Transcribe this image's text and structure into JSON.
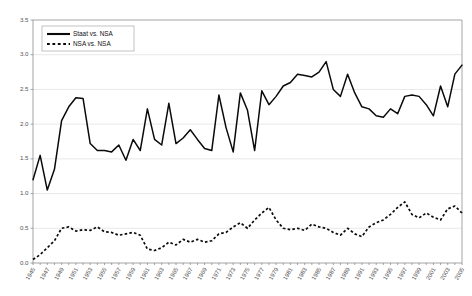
{
  "chart_data": {
    "type": "line",
    "title": "",
    "xlabel": "",
    "ylabel": "",
    "ylim": [
      0.0,
      3.5
    ],
    "ytick_labels": [
      "0.0",
      "0.5",
      "1.0",
      "1.5",
      "2.0",
      "2.5",
      "3.0",
      "3.5"
    ],
    "ytick_values": [
      0.0,
      0.5,
      1.0,
      1.5,
      2.0,
      2.5,
      3.0,
      3.5
    ],
    "grid": true,
    "legend_position": "top-left-inside",
    "x": [
      1945,
      1946,
      1947,
      1948,
      1949,
      1950,
      1951,
      1952,
      1953,
      1954,
      1955,
      1956,
      1957,
      1958,
      1959,
      1960,
      1961,
      1962,
      1963,
      1964,
      1965,
      1966,
      1967,
      1968,
      1969,
      1970,
      1971,
      1972,
      1973,
      1974,
      1975,
      1976,
      1977,
      1978,
      1979,
      1980,
      1981,
      1982,
      1983,
      1984,
      1985,
      1986,
      1987,
      1988,
      1989,
      1990,
      1991,
      1992,
      1993,
      1994,
      1995,
      1996,
      1997,
      1998,
      1999,
      2000,
      2001,
      2002,
      2003,
      2004,
      2005
    ],
    "xtick_labels": [
      "1945",
      "1947",
      "1949",
      "1951",
      "1953",
      "1955",
      "1957",
      "1959",
      "1961",
      "1963",
      "1965",
      "1967",
      "1969",
      "1971",
      "1973",
      "1975",
      "1977",
      "1979",
      "1981",
      "1983",
      "1985",
      "1987",
      "1989",
      "1991",
      "1993",
      "1995",
      "1997",
      "1999",
      "2001",
      "2003",
      "2005"
    ],
    "series": [
      {
        "name": "Staat vs. NSA",
        "style": "solid",
        "color": "#0a0a0a",
        "values": [
          1.2,
          1.55,
          1.05,
          1.35,
          2.05,
          2.25,
          2.38,
          2.37,
          1.72,
          1.62,
          1.62,
          1.6,
          1.7,
          1.48,
          1.78,
          1.62,
          2.22,
          1.78,
          1.7,
          2.3,
          1.72,
          1.8,
          1.92,
          1.78,
          1.65,
          1.62,
          2.42,
          1.95,
          1.6,
          2.45,
          2.2,
          1.62,
          2.48,
          2.28,
          2.4,
          2.55,
          2.6,
          2.72,
          2.7,
          2.68,
          2.75,
          2.9,
          2.5,
          2.4,
          2.72,
          2.45,
          2.25,
          2.22,
          2.12,
          2.1,
          2.22,
          2.15,
          2.4,
          2.42,
          2.4,
          2.28,
          2.12,
          2.55,
          2.25,
          2.72,
          2.85
        ]
      },
      {
        "name": "NSA vs. NSA",
        "style": "dashed",
        "color": "#0a0a0a",
        "values": [
          0.05,
          0.12,
          0.22,
          0.32,
          0.5,
          0.52,
          0.46,
          0.48,
          0.47,
          0.52,
          0.45,
          0.44,
          0.4,
          0.42,
          0.44,
          0.4,
          0.2,
          0.18,
          0.22,
          0.3,
          0.26,
          0.34,
          0.3,
          0.34,
          0.3,
          0.32,
          0.42,
          0.44,
          0.52,
          0.58,
          0.5,
          0.62,
          0.72,
          0.8,
          0.62,
          0.5,
          0.48,
          0.5,
          0.47,
          0.56,
          0.52,
          0.5,
          0.44,
          0.4,
          0.5,
          0.42,
          0.38,
          0.52,
          0.58,
          0.62,
          0.7,
          0.8,
          0.88,
          0.7,
          0.65,
          0.72,
          0.66,
          0.62,
          0.78,
          0.82,
          0.72
        ]
      }
    ]
  },
  "legend": {
    "items": [
      {
        "label": "Staat vs. NSA",
        "style": "solid"
      },
      {
        "label": "NSA vs. NSA",
        "style": "dashed"
      }
    ]
  }
}
